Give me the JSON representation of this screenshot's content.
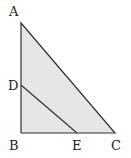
{
  "diagram": {
    "type": "geometry-triangle",
    "colors": {
      "fill": "#e6e6e6",
      "stroke": "#333333",
      "label": "#222222"
    },
    "points": {
      "A": "A",
      "B": "B",
      "C": "C",
      "D": "D",
      "E": "E"
    },
    "segments": [
      "AB",
      "BC",
      "CA",
      "DE"
    ]
  }
}
